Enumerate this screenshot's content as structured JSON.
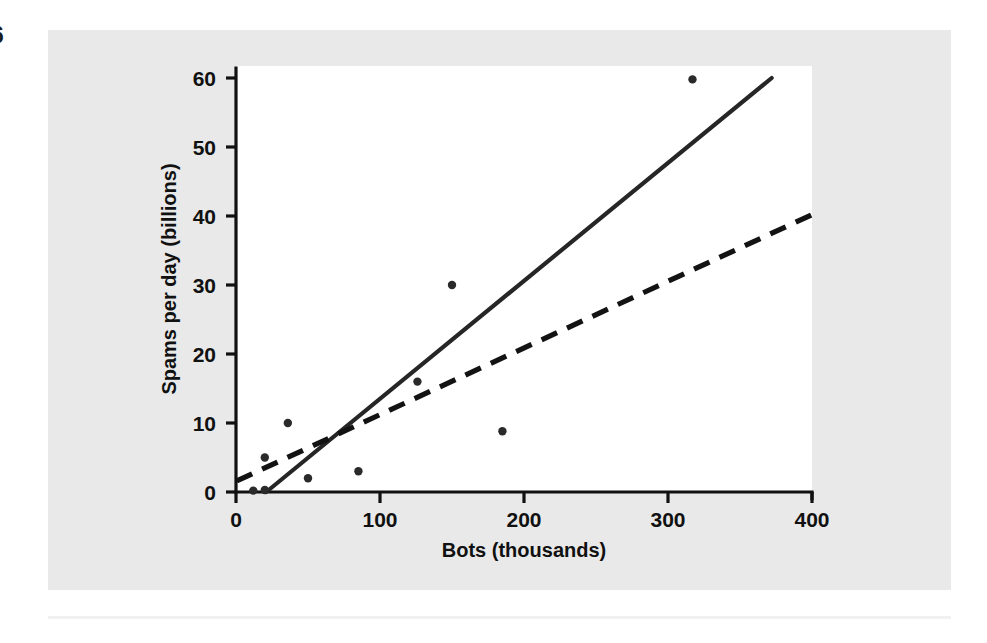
{
  "figure": {
    "folio": "6",
    "panel_bg": "#e9e9e9",
    "plot_bg": "#ffffff",
    "ink": "#111111"
  },
  "chart_data": {
    "type": "scatter",
    "title": "",
    "subtitle": "",
    "xlabel": "Bots (thousands)",
    "ylabel": "Spams per day (billions)",
    "xlim": [
      0,
      400
    ],
    "ylim": [
      0,
      62
    ],
    "xticks": [
      0,
      100,
      200,
      300,
      400
    ],
    "yticks": [
      0,
      10,
      20,
      30,
      40,
      50,
      60
    ],
    "xtick_labels": [
      "0",
      "100",
      "200",
      "300",
      "400"
    ],
    "ytick_labels": [
      "0",
      "10",
      "20",
      "30",
      "40",
      "50",
      "60"
    ],
    "grid": false,
    "legend": "none",
    "points": [
      {
        "x": 12,
        "y": 0.2
      },
      {
        "x": 20,
        "y": 0.3
      },
      {
        "x": 20,
        "y": 5.0
      },
      {
        "x": 36,
        "y": 10.0
      },
      {
        "x": 50,
        "y": 2.0
      },
      {
        "x": 85,
        "y": 3.0
      },
      {
        "x": 126,
        "y": 16.0
      },
      {
        "x": 150,
        "y": 30.0
      },
      {
        "x": 185,
        "y": 8.8
      },
      {
        "x": 317,
        "y": 59.8
      }
    ],
    "series": [
      {
        "name": "solid-fit-line",
        "style": "solid",
        "color": "#262626",
        "x": [
          21,
          372
        ],
        "y": [
          0,
          60
        ]
      },
      {
        "name": "dashed-fit-line",
        "style": "dashed",
        "color": "#131313",
        "x": [
          0.5,
          400
        ],
        "y": [
          1.6,
          40.2
        ]
      }
    ]
  }
}
